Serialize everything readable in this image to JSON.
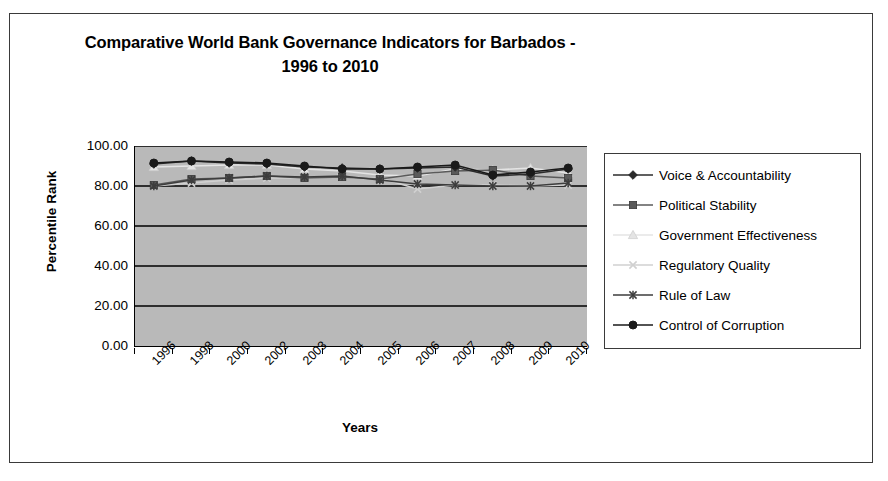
{
  "chart_data": {
    "type": "line",
    "title": "Comparative World Bank Governance Indicators for Barbados - 1996 to 2010",
    "title_line1": "Comparative World Bank Governance Indicators for Barbados -",
    "title_line2": "1996 to 2010",
    "xlabel": "Years",
    "ylabel": "Percentile Rank",
    "categories": [
      "1996",
      "1998",
      "2000",
      "2002",
      "2003",
      "2004",
      "2005",
      "2006",
      "2007",
      "2008",
      "2009",
      "2010"
    ],
    "ylim": [
      0,
      100
    ],
    "ytick_labels": [
      "100.00",
      "80.00",
      "60.00",
      "40.00",
      "20.00",
      "0.00"
    ],
    "ytick_values": [
      100,
      80,
      60,
      40,
      20,
      0
    ],
    "grid": true,
    "legend_position": "right",
    "plot_background": "#b9b9b9",
    "series": [
      {
        "name": "Voice & Accountability",
        "marker": "diamond",
        "color": "#2b2b2b",
        "values": [
          91.0,
          92.5,
          91.5,
          91.0,
          89.5,
          89.0,
          88.5,
          89.0,
          89.5,
          85.0,
          86.0,
          88.5
        ]
      },
      {
        "name": "Political Stability",
        "marker": "square",
        "color": "#5a5a5a",
        "values": [
          80.5,
          83.5,
          84.0,
          85.0,
          84.0,
          84.5,
          83.5,
          86.0,
          87.5,
          88.0,
          85.0,
          84.0
        ]
      },
      {
        "name": "Government Effectiveness",
        "marker": "triangle",
        "color": "#e4e4e4",
        "values": [
          89.5,
          90.0,
          90.5,
          90.5,
          88.5,
          87.5,
          85.5,
          85.0,
          88.5,
          88.0,
          89.0,
          86.5
        ]
      },
      {
        "name": "Regulatory Quality",
        "marker": "cross",
        "color": "#d0d0d0",
        "values": [
          80.0,
          81.5,
          83.0,
          84.0,
          84.0,
          84.5,
          84.0,
          78.5,
          80.5,
          80.5,
          80.0,
          80.5
        ]
      },
      {
        "name": "Rule of Law",
        "marker": "asterisk",
        "color": "#3d3d3d",
        "values": [
          80.0,
          83.0,
          84.0,
          85.0,
          84.5,
          85.0,
          83.0,
          81.0,
          80.5,
          80.0,
          80.0,
          81.5
        ]
      },
      {
        "name": "Control of Corruption",
        "marker": "circle",
        "color": "#1a1a1a",
        "values": [
          91.5,
          92.5,
          92.0,
          91.5,
          90.0,
          88.5,
          88.5,
          89.5,
          90.5,
          85.5,
          87.0,
          89.0
        ]
      }
    ]
  }
}
